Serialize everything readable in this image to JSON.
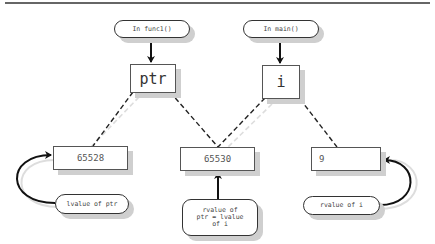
{
  "diagram": {
    "type": "memory-pointer-diagram",
    "scopes": [
      {
        "id": "func1",
        "label": "In func1()"
      },
      {
        "id": "main",
        "label": "In main()"
      }
    ],
    "variables": [
      {
        "id": "ptr",
        "name": "ptr",
        "scope": "func1"
      },
      {
        "id": "i",
        "name": "i",
        "scope": "main"
      }
    ],
    "cells": [
      {
        "id": "cell-65528",
        "value": "65528"
      },
      {
        "id": "cell-65530",
        "value": "65530"
      },
      {
        "id": "cell-9",
        "value": "9"
      }
    ],
    "annotations": [
      {
        "id": "lvalue-ptr",
        "label": "lvalue of ptr"
      },
      {
        "id": "rvalue-ptr",
        "lines": [
          "rvalue of",
          "ptr = lvalue",
          "of i"
        ]
      },
      {
        "id": "rvalue-i",
        "label": "rvalue of i"
      }
    ],
    "edges": [
      {
        "from": "func1",
        "to": "ptr",
        "style": "solid-arrow"
      },
      {
        "from": "main",
        "to": "i",
        "style": "solid-arrow"
      },
      {
        "from": "ptr",
        "to": "cell-65528",
        "style": "dashed"
      },
      {
        "from": "ptr",
        "to": "cell-65530",
        "style": "dashed"
      },
      {
        "from": "i",
        "to": "cell-65530",
        "style": "dashed"
      },
      {
        "from": "i",
        "to": "cell-9",
        "style": "dashed"
      },
      {
        "from": "lvalue-ptr",
        "to": "cell-65528",
        "style": "curved-arrow"
      },
      {
        "from": "rvalue-ptr",
        "to": "cell-65530",
        "style": "solid-arrow"
      },
      {
        "from": "rvalue-i",
        "to": "cell-9",
        "style": "curved-arrow"
      }
    ]
  },
  "colors": {
    "line": "#111111",
    "shadow": "#cfcfcf",
    "border": "#555555",
    "text": "#444444"
  }
}
